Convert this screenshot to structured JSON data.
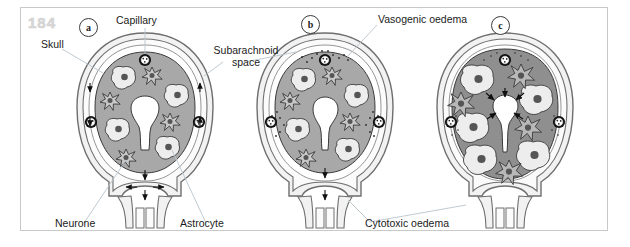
{
  "figure": {
    "page_number": "184",
    "panels": [
      {
        "id": "a",
        "letter": "a",
        "title": "normal brain"
      },
      {
        "id": "b",
        "letter": "b",
        "title": "vasogenic oedema"
      },
      {
        "id": "c",
        "letter": "c",
        "title": "cytotoxic oedema"
      }
    ],
    "labels": [
      {
        "name": "skull",
        "text": "Skull"
      },
      {
        "name": "capillary",
        "text": "Capillary"
      },
      {
        "name": "subarachnoid-space",
        "text": "Subarachnoid\nspace",
        "line1": "Subarachnoid",
        "line2": "space"
      },
      {
        "name": "vasogenic-oedema",
        "text": "Vasogenic oedema"
      },
      {
        "name": "neurone",
        "text": "Neurone"
      },
      {
        "name": "astrocyte",
        "text": "Astrocyte"
      },
      {
        "name": "cytotoxic-oedema",
        "text": "Cytotoxic oedema"
      }
    ]
  },
  "colors": {
    "background": "#ffffff",
    "frame_border": "#c9c9c9",
    "page_number": "#d8d8d8",
    "skull_fill": "#f2f2f2",
    "skull_stroke": "#6e6e6e",
    "csf_fill": "#fbfbfb",
    "brain_tissue": "#a8a8a8",
    "brain_tissue_swollen": "#8f8f8f",
    "cell_body_fill": "#ededed",
    "nucleus_fill": "#555555",
    "capillary_ring": "#1a1a1a",
    "ventricle_fill": "#ffffff",
    "leader_line": "#b8c4cc",
    "text": "#1b1b1b",
    "arrow": "#111111",
    "oedema_dots": "#2b2b2b"
  },
  "diagram": {
    "type": "medical-illustration",
    "panel_a": {
      "caption": "Normal brain",
      "capillaries": 3,
      "neurones": 5,
      "astrocytes": 5,
      "ventricle": "open, star/keyhole shaped",
      "csf_flow_arrows": "downward along subarachnoid space and out through the stem",
      "oedema_dots": 0
    },
    "panel_b": {
      "caption": "Vasogenic oedema",
      "capillaries": 3,
      "neurones": 5,
      "astrocytes": 5,
      "ventricle": "open, slightly narrowed",
      "csf_flow_arrows": "downward through the stem",
      "oedema_dots": "fluid leaking out around each capillary"
    },
    "panel_c": {
      "caption": "Cytotoxic oedema",
      "capillaries": 3,
      "neurones": 6,
      "astrocytes": 4,
      "ventricle": "compressed / slit-like",
      "csf_flow_arrows": "inward arrows compressing the ventricle",
      "oedema_dots": "sparse, cells themselves are swollen"
    }
  }
}
